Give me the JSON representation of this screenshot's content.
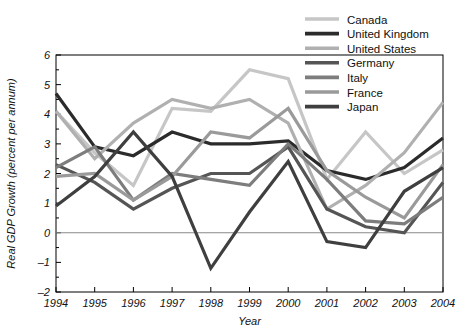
{
  "chart_data": {
    "type": "line",
    "title": "",
    "xlabel": "Year",
    "ylabel": "Real GDP Growth (percent per annum)",
    "x": [
      1994,
      1995,
      1996,
      1997,
      1998,
      1999,
      2000,
      2001,
      2002,
      2003,
      2004
    ],
    "xtick_labels": [
      "1994",
      "1995",
      "1996",
      "1997",
      "1998",
      "1999",
      "2000",
      "2001",
      "2002",
      "2003",
      "2004"
    ],
    "ytick_labels": [
      "6",
      "5",
      "4",
      "3",
      "2",
      "1",
      "0",
      "-1",
      "-2"
    ],
    "ylim": [
      -2,
      6
    ],
    "xlim": [
      1994,
      2004
    ],
    "grid": false,
    "zero_line": true,
    "legend_position": "top-right",
    "series": [
      {
        "name": "Canada",
        "color": "#c6c6c6",
        "values": [
          4.1,
          2.7,
          1.6,
          4.2,
          4.1,
          5.5,
          5.2,
          1.8,
          3.4,
          2.0,
          2.8
        ]
      },
      {
        "name": "United Kingdom",
        "color": "#2b2b2b",
        "values": [
          4.7,
          2.9,
          2.6,
          3.4,
          3.0,
          3.0,
          3.1,
          2.1,
          1.8,
          2.2,
          3.2
        ]
      },
      {
        "name": "United States",
        "color": "#b0b0b0",
        "values": [
          4.1,
          2.5,
          3.7,
          4.5,
          4.2,
          4.5,
          3.7,
          0.8,
          1.6,
          2.7,
          4.4
        ]
      },
      {
        "name": "Germany",
        "color": "#555555",
        "values": [
          2.3,
          1.7,
          0.8,
          1.5,
          2.0,
          2.0,
          2.9,
          0.8,
          0.2,
          0.0,
          1.7
        ]
      },
      {
        "name": "Italy",
        "color": "#7d7d7d",
        "values": [
          2.2,
          2.9,
          1.1,
          2.0,
          1.8,
          1.6,
          3.0,
          1.8,
          0.4,
          0.3,
          1.2
        ]
      },
      {
        "name": "France",
        "color": "#9a9a9a",
        "values": [
          1.9,
          2.0,
          1.1,
          1.9,
          3.4,
          3.2,
          4.2,
          2.1,
          1.2,
          0.5,
          2.3
        ]
      },
      {
        "name": "Japan",
        "color": "#3f3f3f",
        "values": [
          0.9,
          1.9,
          3.4,
          1.9,
          -1.2,
          0.7,
          2.4,
          -0.3,
          -0.5,
          1.4,
          2.2
        ]
      }
    ]
  },
  "legend": {
    "entries": [
      {
        "label": "Canada"
      },
      {
        "label": "United Kingdom"
      },
      {
        "label": "United States"
      },
      {
        "label": "Germany"
      },
      {
        "label": "Italy"
      },
      {
        "label": "France"
      },
      {
        "label": "Japan"
      }
    ]
  }
}
